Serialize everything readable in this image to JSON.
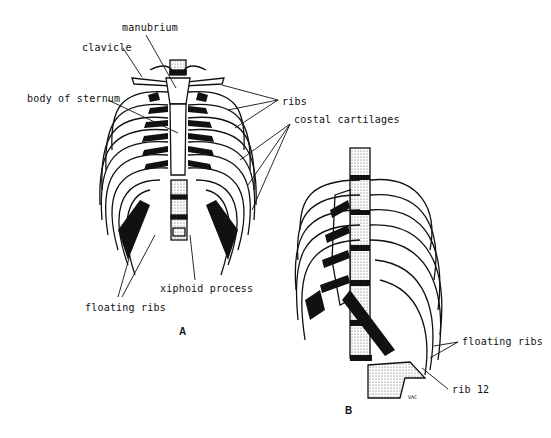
{
  "diagram": {
    "figures": [
      {
        "id": "A",
        "view": "anterior",
        "label": "A",
        "labels": [
          {
            "text": "manubrium",
            "x": 122,
            "y": 22
          },
          {
            "text": "clavicle",
            "x": 82,
            "y": 42
          },
          {
            "text": "body of sternum",
            "x": 27,
            "y": 93
          },
          {
            "text": "ribs",
            "x": 282,
            "y": 96
          },
          {
            "text": "costal cartilages",
            "x": 294,
            "y": 114
          },
          {
            "text": "xiphoid process",
            "x": 160,
            "y": 283
          },
          {
            "text": "floating ribs",
            "x": 85,
            "y": 302
          }
        ]
      },
      {
        "id": "B",
        "view": "anterolateral oblique",
        "label": "B",
        "labels": [
          {
            "text": "floating ribs",
            "x": 462,
            "y": 336
          },
          {
            "text": "rib 12",
            "x": 452,
            "y": 384
          }
        ]
      }
    ],
    "signature": "VAC"
  }
}
